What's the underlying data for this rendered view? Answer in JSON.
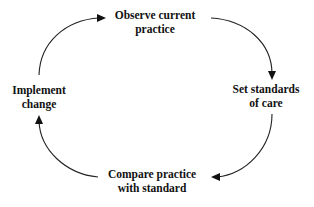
{
  "diagram": {
    "type": "cycle",
    "direction": "clockwise",
    "colors": {
      "text": "#111111",
      "arrow": "#222222",
      "background": "#ffffff"
    },
    "nodes": [
      {
        "id": "observe",
        "line1": "Observe current",
        "line2": "practice"
      },
      {
        "id": "standards",
        "line1": "Set standards",
        "line2": "of care"
      },
      {
        "id": "compare",
        "line1": "Compare practice",
        "line2": "with standard"
      },
      {
        "id": "implement",
        "line1": "Implement",
        "line2": "change"
      }
    ],
    "edges": [
      {
        "from": "observe",
        "to": "standards"
      },
      {
        "from": "standards",
        "to": "compare"
      },
      {
        "from": "compare",
        "to": "implement"
      },
      {
        "from": "implement",
        "to": "observe"
      }
    ]
  }
}
